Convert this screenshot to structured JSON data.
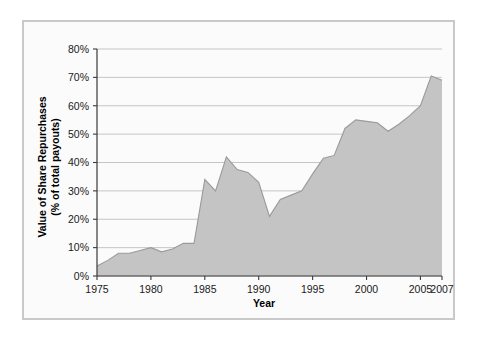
{
  "chart_data": {
    "type": "area",
    "title": "",
    "xlabel": "Year",
    "ylabel": "Value of Share Repurchases (% of total payouts)",
    "ylabel_line1": "Value of Share Repurchases",
    "ylabel_line2": "(% of total payouts)",
    "xlim": [
      1975,
      2007
    ],
    "ylim": [
      0,
      80
    ],
    "grid": true,
    "legend": "none",
    "y_tick_labels": [
      "0%",
      "10%",
      "20%",
      "30%",
      "40%",
      "50%",
      "60%",
      "70%",
      "80%"
    ],
    "y_tick_values": [
      0,
      10,
      20,
      30,
      40,
      50,
      60,
      70,
      80
    ],
    "x_tick_labels": [
      "1975",
      "1980",
      "1985",
      "1990",
      "1995",
      "2000",
      "2005",
      "2007"
    ],
    "x_tick_values": [
      1975,
      1980,
      1985,
      1990,
      1995,
      2000,
      2005,
      2007
    ],
    "series": [
      {
        "name": "Value of Share Repurchases",
        "fill_color": "#c4c4c4",
        "line_color": "#9a9a9a",
        "x": [
          1975,
          1976,
          1977,
          1978,
          1979,
          1980,
          1981,
          1982,
          1983,
          1984,
          1985,
          1986,
          1987,
          1988,
          1989,
          1990,
          1991,
          1992,
          1993,
          1994,
          1995,
          1996,
          1997,
          1998,
          1999,
          2000,
          2001,
          2002,
          2003,
          2004,
          2005,
          2006,
          2007
        ],
        "values": [
          3.5,
          5.5,
          8.0,
          8.0,
          9.0,
          10.0,
          8.5,
          9.5,
          11.5,
          11.5,
          34.0,
          30.0,
          42.0,
          37.5,
          36.5,
          33.0,
          21.0,
          27.0,
          28.5,
          30.0,
          36.0,
          41.5,
          42.5,
          52.0,
          55.0,
          54.5,
          54.0,
          51.0,
          53.5,
          56.5,
          60.0,
          70.5,
          69.0
        ]
      }
    ]
  },
  "frame": {
    "border_color": "#c9c9c9",
    "background_color": "#fbfbfb"
  }
}
